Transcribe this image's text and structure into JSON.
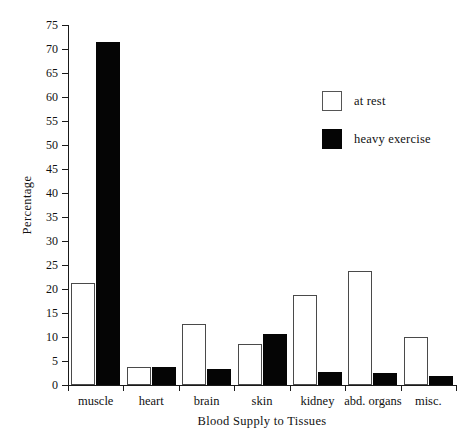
{
  "chart_data": {
    "type": "bar",
    "title": "",
    "xlabel": "Blood Supply to Tissues",
    "ylabel": "Percentage",
    "categories": [
      "muscle",
      "heart",
      "brain",
      "skin",
      "kidney",
      "abd. organs",
      "misc."
    ],
    "series": [
      {
        "name": "at rest",
        "color": "#ffffff",
        "values": [
          21.3,
          3.8,
          12.7,
          8.5,
          18.8,
          23.8,
          10.0
        ]
      },
      {
        "name": "heavy exercise",
        "color": "#050505",
        "values": [
          71.5,
          3.8,
          3.3,
          10.6,
          2.7,
          2.5,
          1.9
        ]
      }
    ],
    "ylim": [
      0,
      75
    ],
    "yticks": [
      0,
      5,
      10,
      15,
      20,
      25,
      30,
      35,
      40,
      45,
      50,
      55,
      60,
      65,
      70,
      75
    ],
    "ytick_labels": [
      "0",
      "5",
      "10",
      "15",
      "20",
      "25",
      "30",
      "35",
      "40",
      "45",
      "50",
      "55",
      "60",
      "65",
      "70",
      "75"
    ],
    "grid": false,
    "legend_position": "upper right"
  },
  "legend": {
    "entries": [
      {
        "label": "at rest",
        "swatch": "white-square-icon"
      },
      {
        "label": "heavy exercise",
        "swatch": "black-square-icon"
      }
    ]
  }
}
